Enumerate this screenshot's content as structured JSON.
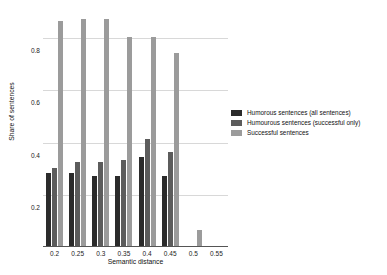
{
  "chart_data": {
    "type": "bar",
    "title": "",
    "xlabel": "Semantic distance",
    "ylabel": "Share of sentences",
    "categories": [
      "0.2",
      "0.25",
      "0.3",
      "0.35",
      "0.4",
      "0.45",
      "0.5",
      "0.55"
    ],
    "xticks": [
      "0.2",
      "0.25",
      "0.3",
      "0.35",
      "0.4",
      "0.45",
      "0.5",
      "0.55"
    ],
    "yticks": [
      "0.2",
      "0.4",
      "0.6",
      "0.8"
    ],
    "ytick_values": [
      0.2,
      0.4,
      0.6,
      0.8
    ],
    "ylim": [
      0,
      0.9
    ],
    "grid": "horizontal",
    "legend_position": "right",
    "series": [
      {
        "name": "Humorous sentences (all sentences)",
        "color": "#2b2b2b",
        "values": [
          0.28,
          0.28,
          0.27,
          0.27,
          0.34,
          0.27,
          0,
          0
        ]
      },
      {
        "name": "Humourous sentences (successful only)",
        "color": "#5c5c5c",
        "values": [
          0.3,
          0.32,
          0.32,
          0.33,
          0.41,
          0.36,
          0,
          0
        ]
      },
      {
        "name": "Successful sentences",
        "color": "#9b9b9b",
        "values": [
          0.86,
          0.87,
          0.87,
          0.8,
          0.8,
          0.74,
          0.06,
          0
        ]
      }
    ]
  }
}
